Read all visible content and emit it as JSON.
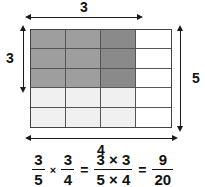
{
  "figure": {
    "grid": {
      "columns": 4,
      "rows": 5,
      "cells": [
        [
          {
            "shade": "dark"
          },
          {
            "shade": "dark"
          },
          {
            "shade": "darker"
          },
          {
            "shade": "white"
          }
        ],
        [
          {
            "shade": "dark"
          },
          {
            "shade": "dark"
          },
          {
            "shade": "darker"
          },
          {
            "shade": "white"
          }
        ],
        [
          {
            "shade": "dark"
          },
          {
            "shade": "dark"
          },
          {
            "shade": "darker"
          },
          {
            "shade": "white"
          }
        ],
        [
          {
            "shade": "light"
          },
          {
            "shade": "light"
          },
          {
            "shade": "light"
          },
          {
            "shade": "white"
          }
        ],
        [
          {
            "shade": "light"
          },
          {
            "shade": "light"
          },
          {
            "shade": "light"
          },
          {
            "shade": "white"
          }
        ]
      ],
      "palette": {
        "dark": "#9e9e9e",
        "darker": "#8a8a8a",
        "light": "#f0f0f0",
        "white": "#ffffff",
        "line": "#555555",
        "border": "#444444"
      }
    },
    "dimensions": {
      "top": {
        "label": "3",
        "name": "top-width-3"
      },
      "left": {
        "label": "3",
        "name": "left-height-3"
      },
      "right": {
        "label": "5",
        "name": "right-height-5"
      },
      "bottom": {
        "label": "4",
        "name": "bottom-width-4"
      }
    },
    "equation": {
      "f1": {
        "num": "3",
        "den": "5"
      },
      "op1": "×",
      "f2": {
        "num": "3",
        "den": "4"
      },
      "eq1": "=",
      "f3": {
        "num": "3 × 3",
        "den": "5 × 4"
      },
      "eq2": "=",
      "f4": {
        "num": "9",
        "den": "20"
      }
    }
  }
}
